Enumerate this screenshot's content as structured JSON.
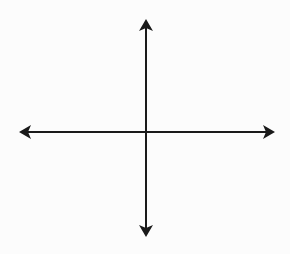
{
  "diagram": {
    "type": "coordinate-axes",
    "description": "Blank Cartesian plane with x and y axes, arrows at both ends of each axis",
    "colors": {
      "background": "#fcfcfc",
      "axis_stroke": "#1a1a1a"
    },
    "origin": {
      "x": 146,
      "y": 132
    },
    "x_axis": {
      "from": {
        "x": 19,
        "y": 132
      },
      "to": {
        "x": 275,
        "y": 132
      },
      "arrows": [
        "left",
        "right"
      ],
      "label": ""
    },
    "y_axis": {
      "from": {
        "x": 146,
        "y": 19
      },
      "to": {
        "x": 146,
        "y": 237
      },
      "arrows": [
        "up",
        "down"
      ],
      "label": ""
    }
  }
}
